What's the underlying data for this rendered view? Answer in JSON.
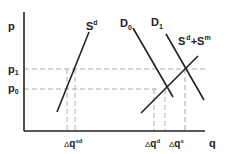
{
  "diagram": {
    "axes": {
      "y_label": "p",
      "x_label": "q",
      "price_levels": [
        {
          "name": "p1",
          "base": "p",
          "sub": "1"
        },
        {
          "name": "p0",
          "base": "p",
          "sub": "0"
        }
      ]
    },
    "curves": [
      {
        "name": "S^d",
        "base": "S",
        "sup": "d"
      },
      {
        "name": "D_0",
        "base": "D",
        "sub": "0"
      },
      {
        "name": "D_1",
        "base": "D",
        "sub": "1"
      },
      {
        "name": "S^d+S^m",
        "base1": "S",
        "sup1": "d",
        "plus": "+",
        "base2": "S",
        "sup2": "m"
      }
    ],
    "quantity_changes": [
      {
        "name": "Δq^sd",
        "delta": "Δ",
        "base": "q",
        "sup": "sd"
      },
      {
        "name": "Δq^d",
        "delta": "Δ",
        "base": "q",
        "sup": "d"
      },
      {
        "name": "Δq^s",
        "delta": "Δ",
        "base": "q",
        "sup": "s"
      }
    ],
    "colors": {
      "line": "#222222",
      "dash": "#aaaaaa"
    }
  }
}
